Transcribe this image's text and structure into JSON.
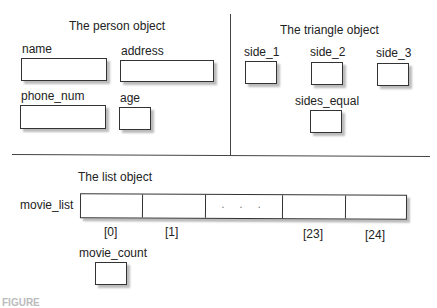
{
  "person": {
    "title": "The person object",
    "fields": [
      {
        "label": "name"
      },
      {
        "label": "address"
      },
      {
        "label": "phone_num"
      },
      {
        "label": "age"
      }
    ]
  },
  "triangle": {
    "title": "The triangle object",
    "fields": [
      {
        "label": "side_1"
      },
      {
        "label": "side_2"
      },
      {
        "label": "side_3"
      },
      {
        "label": "sides_equal"
      }
    ]
  },
  "list": {
    "title": "The list object",
    "array_label": "movie_list",
    "ellipsis": "· · ·",
    "indices": [
      "[0]",
      "[1]",
      "[23]",
      "[24]"
    ],
    "count_label": "movie_count"
  },
  "caption": "FIGURE"
}
